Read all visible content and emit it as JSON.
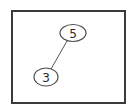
{
  "diagram": {
    "type": "binary-tree",
    "nodes": [
      {
        "id": "n5",
        "label": "5",
        "cx": 73,
        "cy": 33,
        "rx": 13,
        "ry": 8.5
      },
      {
        "id": "n3",
        "label": "3",
        "cx": 46,
        "cy": 77,
        "rx": 12,
        "ry": 9
      }
    ],
    "edges": [
      {
        "from": "n5",
        "to": "n3",
        "x1": 67,
        "y1": 41,
        "x2": 51,
        "y2": 69
      }
    ]
  },
  "colors": {
    "stroke": "#4a4a4a",
    "frame": "#3a3a3a",
    "background": "#ffffff"
  }
}
